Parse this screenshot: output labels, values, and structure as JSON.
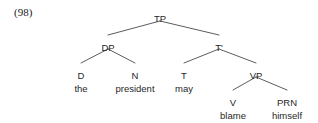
{
  "figure": {
    "example_number": "(98)",
    "background_color": "#ffffff",
    "line_color": "#4a4a4a",
    "text_color": "#1f1f1f"
  },
  "tree": {
    "nodes": [
      {
        "id": "TP",
        "label": "TP",
        "x": 160,
        "y": 13
      },
      {
        "id": "DP",
        "label": "DP",
        "x": 108,
        "y": 42
      },
      {
        "id": "Tbar",
        "label": "T'",
        "x": 219,
        "y": 42
      },
      {
        "id": "D",
        "label": "D",
        "x": 81,
        "y": 70
      },
      {
        "id": "N",
        "label": "N",
        "x": 135,
        "y": 70
      },
      {
        "id": "T",
        "label": "T",
        "x": 184,
        "y": 70
      },
      {
        "id": "VP",
        "label": "VP",
        "x": 256,
        "y": 70
      },
      {
        "id": "V",
        "label": "V",
        "x": 233,
        "y": 97
      },
      {
        "id": "PRN",
        "label": "PRN",
        "x": 287,
        "y": 97
      }
    ],
    "terminals": [
      {
        "id": "the",
        "word": "the",
        "x": 81,
        "y": 83
      },
      {
        "id": "president",
        "word": "president",
        "x": 135,
        "y": 83
      },
      {
        "id": "may",
        "word": "may",
        "x": 184,
        "y": 83
      },
      {
        "id": "blame",
        "word": "blame",
        "x": 233,
        "y": 110
      },
      {
        "id": "himself",
        "word": "himself",
        "x": 287,
        "y": 110
      }
    ],
    "edges": [
      {
        "from": "TP",
        "to": "DP",
        "x1": 160,
        "y1": 21,
        "x2": 108,
        "y2": 35
      },
      {
        "from": "TP",
        "to": "Tbar",
        "x1": 160,
        "y1": 21,
        "x2": 219,
        "y2": 35
      },
      {
        "from": "DP",
        "to": "D",
        "x1": 108,
        "y1": 49,
        "x2": 81,
        "y2": 63
      },
      {
        "from": "DP",
        "to": "N",
        "x1": 108,
        "y1": 49,
        "x2": 135,
        "y2": 63
      },
      {
        "from": "Tbar",
        "to": "T",
        "x1": 219,
        "y1": 49,
        "x2": 184,
        "y2": 63
      },
      {
        "from": "Tbar",
        "to": "VP",
        "x1": 219,
        "y1": 49,
        "x2": 256,
        "y2": 63
      },
      {
        "from": "VP",
        "to": "V",
        "x1": 256,
        "y1": 77,
        "x2": 233,
        "y2": 90
      },
      {
        "from": "VP",
        "to": "PRN",
        "x1": 256,
        "y1": 77,
        "x2": 287,
        "y2": 90
      }
    ]
  }
}
